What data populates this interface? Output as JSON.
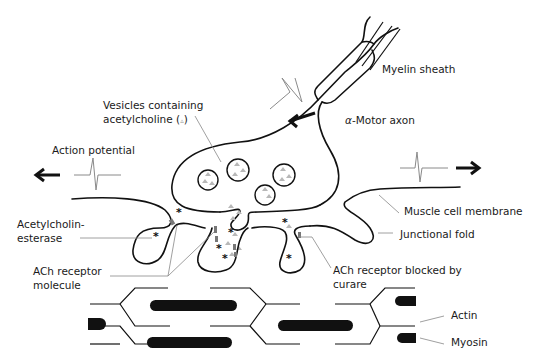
{
  "labels": {
    "myelin_sheath": "Myelin sheath",
    "motor_axon_prefix": "α",
    "motor_axon": "-Motor axon",
    "vesicles_line1": "Vesicles containing",
    "vesicles_line2": "acetylcholine (",
    "vesicles_symbol": "▵",
    "vesicles_close": ")",
    "action_potential": "Action potential",
    "acetylcholinesterase_line1": "Acetylcholin-",
    "acetylcholinesterase_line2": "esterase",
    "ach_receptor_line1": "ACh receptor",
    "ach_receptor_line2": "molecule",
    "ach_blocked_line1": "ACh receptor blocked by",
    "ach_blocked_line2": "curare",
    "muscle_membrane": "Muscle cell membrane",
    "junctional_fold": "Junctional fold",
    "actin": "Actin",
    "myosin": "Myosin"
  },
  "symbols": {
    "esterase_marker": "*"
  },
  "colors": {
    "ink": "#111111",
    "leader": "#888888",
    "acetylcholine": "#b8b8b8",
    "receptor": "#777777",
    "background": "#ffffff"
  }
}
